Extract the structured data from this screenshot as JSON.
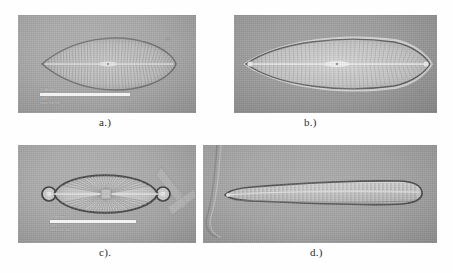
{
  "figure": {
    "type": "photomicrograph-plate",
    "layout": "2x2",
    "background_color": "#ffffff",
    "panel_background": "#a9a9a9"
  },
  "panels": [
    {
      "id": "a",
      "caption": "a.)",
      "subject": "diatom-valve-lanceolate",
      "description": "Lanceolate diatom valve in valve view with acute apices, central area and radiate striae",
      "field_color": "#ababab",
      "valve_color": "#c6c6c6",
      "outline_color": "#6e6e6e",
      "stria_count": 58,
      "has_scalebar": true,
      "scalebar": {
        "label_top": "10 Microns",
        "label_line1": "20kV",
        "label_line2": "Leica  500    1kX"
      }
    },
    {
      "id": "b",
      "caption": "b.)",
      "subject": "diatom-valve-elongate-lanceolate",
      "description": "Elongate linear-lanceolate diatom valve with bright refractive margin and fine transapical striae",
      "field_color": "#9e9e9e",
      "valve_color": "#d2d2d2",
      "outline_color": "#5d5d5d",
      "stria_count": 92,
      "has_scalebar": false
    },
    {
      "id": "c",
      "caption": "c).",
      "subject": "diatom-valve-elliptic-capitate",
      "description": "Broadly elliptic diatom valve with capitate apices, strong dark outline, radiate striae and a debris fragment at right",
      "field_color": "#ababab",
      "valve_color": "#c9c9c9",
      "outline_color": "#3f3f3f",
      "stria_count": 62,
      "has_debris": true,
      "has_scalebar": true,
      "scalebar": {
        "label_top": "10 Microns",
        "label_line1": "20kV",
        "label_line2": "Leica  500    1kX"
      }
    },
    {
      "id": "d",
      "caption": "d.)",
      "subject": "diatom-valve-clavate",
      "description": "Long clavate diatom valve tapering from a broad rounded head pole to a narrow foot pole, with a curved fibre artefact at left of field",
      "field_color": "#a6a6a6",
      "valve_color": "#cfcfcf",
      "outline_color": "#4a4a4a",
      "stria_count": 78,
      "has_fibre_artifact": true,
      "has_scalebar": false
    }
  ]
}
